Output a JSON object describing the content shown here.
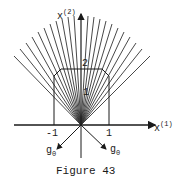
{
  "figure": {
    "caption": "Figure 43",
    "axes": {
      "x1": {
        "base": "x",
        "sup": "(1)"
      },
      "x2": {
        "base": "x",
        "sup": "(2)"
      }
    },
    "ticks": {
      "x_neg1": "-1",
      "x_pos1": "1",
      "y_1": "1",
      "y_2": "2"
    },
    "vectors": {
      "g0_prime": {
        "base": "g",
        "sub": "0",
        "mark": "'"
      },
      "g0": {
        "base": "g",
        "sub": "0"
      }
    },
    "colors": {
      "ink": "#1a1a1a",
      "background": "#ffffff"
    }
  }
}
